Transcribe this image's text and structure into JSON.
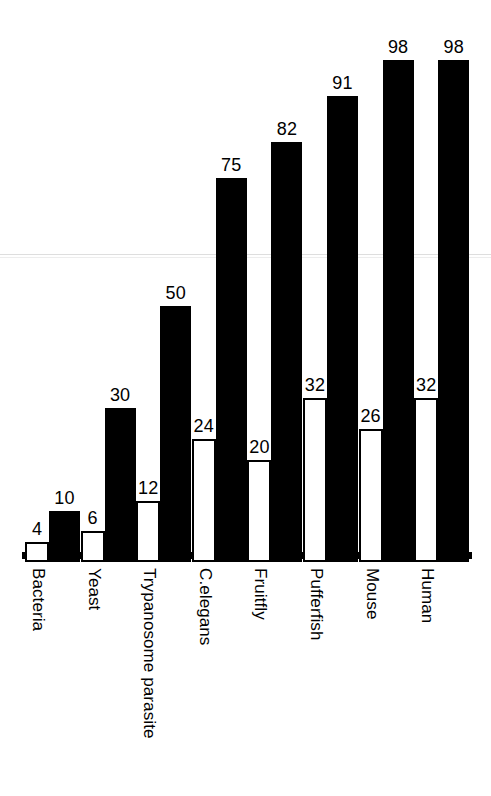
{
  "chart_data": {
    "type": "bar",
    "title": "",
    "subtitle": "",
    "xlabel": "",
    "ylabel": "",
    "ylim": [
      0,
      105
    ],
    "grid": false,
    "legend_position": "none",
    "orientation": "vertical",
    "grouping": "grouped",
    "categories": [
      "Bacteria",
      "Yeast",
      "Trypanosome parasite",
      "C.elegans",
      "Fruitfly",
      "Pufferfish",
      "Mouse",
      "Human"
    ],
    "series": [
      {
        "name": "white-bar",
        "style": "open",
        "fill": "#ffffff",
        "stroke": "#000000",
        "values": [
          4,
          6,
          12,
          24,
          20,
          32,
          26,
          32
        ]
      },
      {
        "name": "black-bar",
        "style": "filled",
        "fill": "#000000",
        "stroke": "#000000",
        "values": [
          10,
          30,
          50,
          75,
          82,
          91,
          98,
          98
        ]
      }
    ],
    "value_labels": {
      "white": [
        "4",
        "6",
        "12",
        "24",
        "20",
        "32",
        "26",
        "32"
      ],
      "black": [
        "10",
        "30",
        "50",
        "75",
        "82",
        "91",
        "98",
        "98"
      ]
    }
  },
  "axis": {
    "baseline_color": "#000000"
  },
  "colors": {
    "ink": "#000000",
    "paper": "#ffffff",
    "scan_artifact": "#d8d8d8"
  }
}
